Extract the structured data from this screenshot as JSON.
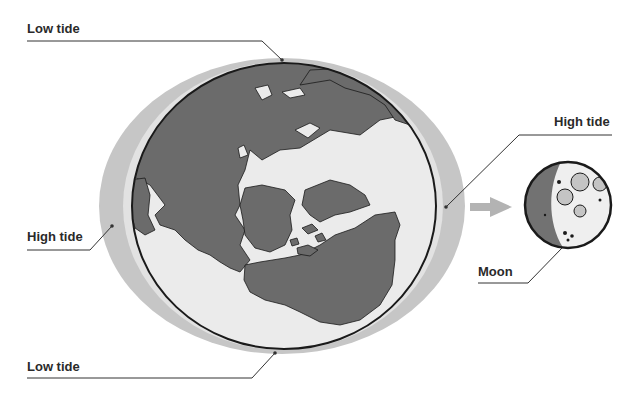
{
  "diagram": {
    "type": "tides-diagram",
    "labels": {
      "low_tide_top": "Low tide",
      "high_tide_left": "High tide",
      "high_tide_right": "High tide",
      "moon": "Moon",
      "low_tide_bottom": "Low tide"
    },
    "elements": {
      "earth": "Earth globe with continents",
      "tidal_bulge": "Water envelope elongated toward/away from Moon",
      "moon": "Moon (partially shaded, cratered)",
      "arrow": "Gravitational pull direction toward Moon"
    },
    "colors": {
      "background": "#ffffff",
      "tidal_bulge": "#c6c6c6",
      "ocean": "#e8e8e8",
      "land": "#6b6b6b",
      "outline": "#1a1a1a",
      "leader_line": "#333333",
      "label_text": "#2a2a2a",
      "arrow": "#b3b3b3",
      "moon_light": "#efefef",
      "moon_dark": "#727272",
      "moon_crater": "#c4c4c4"
    }
  }
}
